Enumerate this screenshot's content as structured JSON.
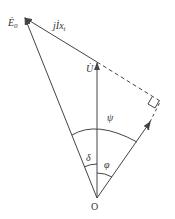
{
  "diagram": {
    "type": "phasor-diagram",
    "labels": {
      "E0": "Ė",
      "E0_sub": "0",
      "U": "U̇",
      "I": "İ",
      "jIxt_j": "j",
      "jIxt_I": "İ",
      "jIxt_x": "x",
      "jIxt_sub": "t",
      "psi": "ψ",
      "delta": "δ",
      "phi": "φ",
      "origin": "O"
    },
    "colors": {
      "line": "#444444",
      "text": "#333333",
      "background": "#ffffff"
    },
    "points": {
      "origin": [
        97,
        198
      ],
      "E0_tip": [
        24,
        17
      ],
      "U_tip": [
        97,
        62
      ],
      "I_tip": [
        150,
        122
      ],
      "perp_foot": [
        160,
        103
      ]
    }
  }
}
